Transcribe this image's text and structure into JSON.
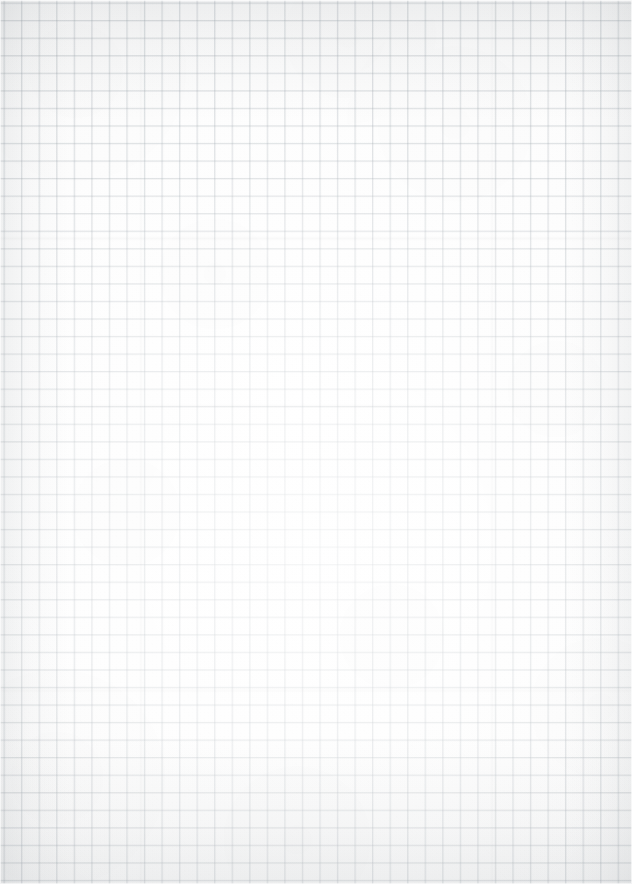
{
  "document": {
    "kind": "graph-paper-scan",
    "title": "Blank graph paper sheet",
    "orientation": "portrait",
    "width_px": 632,
    "height_px": 884,
    "visible_text": "",
    "annotations": [],
    "is_blank": "true"
  },
  "paper": {
    "background_color": "#fcfcfb",
    "highlight_color": "#ffffff",
    "shadow_color": "#f4f5f6",
    "texture": "fine paper grain with soft mottling"
  },
  "grid": {
    "type": "square-ruled",
    "cell_size_px": 17.55,
    "line_color": "#96a0a8",
    "line_width_px": 1,
    "line_opacity": "0.30",
    "origin_offset_x_px": 3.5,
    "origin_offset_y_px": 2.5,
    "columns": 36,
    "rows": 50,
    "has_major_lines": "false"
  },
  "vignette": {
    "top_band_color": "#788086",
    "bottom_band_color": "#788086",
    "side_band_color": "#788086",
    "top_band_height_px": 120,
    "bottom_band_height_px": 150,
    "side_band_width_px": 70
  },
  "artifacts": {
    "scan_streaks_y_px": [
      236,
      404,
      688
    ],
    "fold_lines_x_px": [
      139,
      490
    ]
  }
}
